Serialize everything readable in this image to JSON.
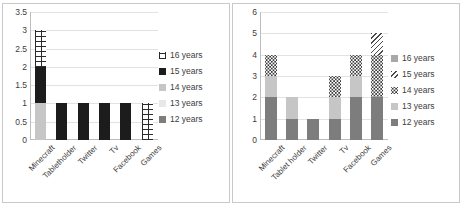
{
  "figure": {
    "type": "two-panel-stacked-bar",
    "panels": 2
  },
  "left_panel": {
    "name": "left-chart",
    "legend_title": "",
    "legend": [
      {
        "label": "16 years",
        "fill": "brick",
        "color": "#2b2b2b"
      },
      {
        "label": "15 years",
        "fill": "dark",
        "color": "#1c1c1c"
      },
      {
        "label": "14 years",
        "fill": "litegray",
        "color": "#c6c6c6"
      },
      {
        "label": "13 years",
        "fill": "palegray",
        "color": "#e8e8e8"
      },
      {
        "label": "12 years",
        "fill": "gray",
        "color": "#7d7d7d"
      }
    ],
    "yticks": [
      "0",
      "0.5",
      "1",
      "1.5",
      "2",
      "2.5",
      "3",
      "3.5"
    ],
    "xlabels": [
      "Minecraft",
      "Tabletholder",
      "Twitter",
      "Tv",
      "Facebook",
      "Games"
    ]
  },
  "right_panel": {
    "name": "right-chart",
    "legend_title": "",
    "legend": [
      {
        "label": "16 years",
        "fill": "midgray",
        "color": "#a8a8a8"
      },
      {
        "label": "15 years",
        "fill": "diag",
        "color": "#4a4a4a"
      },
      {
        "label": "14 years",
        "fill": "dots",
        "color": "#3d3d3d"
      },
      {
        "label": "13 years",
        "fill": "litegray",
        "color": "#c6c6c6"
      },
      {
        "label": "12 years",
        "fill": "gray",
        "color": "#7d7d7d"
      }
    ],
    "yticks": [
      "0",
      "1",
      "2",
      "3",
      "4",
      "5",
      "6"
    ],
    "xlabels": [
      "Minecraft",
      "Tablet holder",
      "Twitter",
      "Tv",
      "Facebook",
      "Games"
    ]
  },
  "chart_data": [
    {
      "type": "bar",
      "stacked": true,
      "title": "",
      "xlabel": "",
      "ylabel": "",
      "ylim": [
        0,
        3.5
      ],
      "ytick_step": 0.5,
      "grid": true,
      "legend_position": "right",
      "categories": [
        "Minecraft",
        "Tabletholder",
        "Twitter",
        "Tv",
        "Facebook",
        "Games"
      ],
      "series": [
        {
          "name": "12 years",
          "fill": "gray",
          "values": [
            0,
            0,
            0,
            0,
            0,
            0
          ]
        },
        {
          "name": "13 years",
          "fill": "palegray",
          "values": [
            0,
            0,
            0,
            0,
            0,
            0
          ]
        },
        {
          "name": "14 years",
          "fill": "litegray",
          "values": [
            1,
            0,
            0,
            0,
            0,
            0
          ]
        },
        {
          "name": "15 years",
          "fill": "dark",
          "values": [
            1,
            1,
            1,
            1,
            1,
            0
          ]
        },
        {
          "name": "16 years",
          "fill": "brick",
          "values": [
            1,
            0,
            0,
            0,
            0,
            1
          ]
        }
      ],
      "totals": [
        3,
        1,
        1,
        1,
        1,
        1
      ]
    },
    {
      "type": "bar",
      "stacked": true,
      "title": "",
      "xlabel": "",
      "ylabel": "",
      "ylim": [
        0,
        6
      ],
      "ytick_step": 1,
      "grid": true,
      "legend_position": "right",
      "categories": [
        "Minecraft",
        "Tablet holder",
        "Twitter",
        "Tv",
        "Facebook",
        "Games"
      ],
      "series": [
        {
          "name": "12 years",
          "fill": "gray",
          "values": [
            2,
            1,
            1,
            1,
            2,
            2
          ]
        },
        {
          "name": "13 years",
          "fill": "litegray",
          "values": [
            1,
            1,
            0,
            1,
            1,
            0
          ]
        },
        {
          "name": "14 years",
          "fill": "dots",
          "values": [
            1,
            0,
            0,
            1,
            1,
            2
          ]
        },
        {
          "name": "15 years",
          "fill": "diag",
          "values": [
            0,
            0,
            0,
            0,
            0,
            1
          ]
        },
        {
          "name": "16 years",
          "fill": "midgray",
          "values": [
            0,
            0,
            0,
            0,
            0,
            0
          ]
        }
      ],
      "totals": [
        4,
        2,
        1,
        3,
        4,
        5
      ]
    }
  ]
}
